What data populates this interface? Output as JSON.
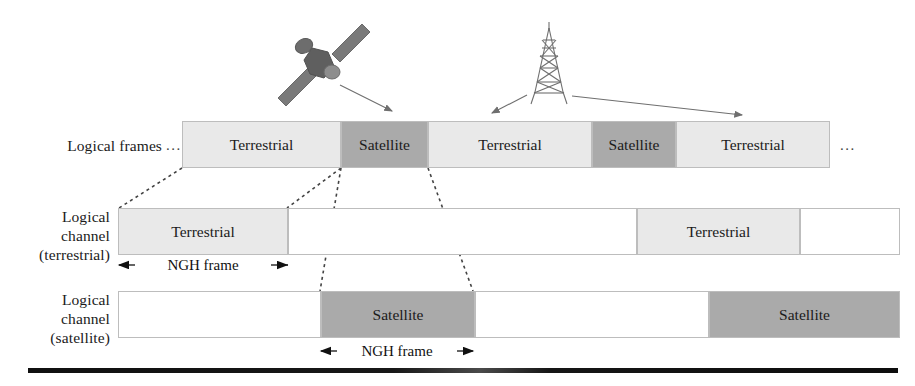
{
  "figure": {
    "colors": {
      "terrestrial_fill": "#e9e9e9",
      "satellite_fill": "#aaaaaa",
      "empty_fill": "#ffffff",
      "outline": "#bdbdbd",
      "text": "#1b1b1b",
      "bottom_bar": "#111111"
    }
  },
  "icons": {
    "satellite": "satellite-icon",
    "tower": "broadcast-tower-icon"
  },
  "rows": {
    "logical_frames": {
      "label": "Logical frames",
      "leading_ellipsis": "...",
      "trailing_ellipsis": "...",
      "cells": [
        {
          "label": "Terrestrial",
          "type": "terrestrial"
        },
        {
          "label": "Satellite",
          "type": "satellite"
        },
        {
          "label": "Terrestrial",
          "type": "terrestrial"
        },
        {
          "label": "Satellite",
          "type": "satellite"
        },
        {
          "label": "Terrestrial",
          "type": "terrestrial"
        }
      ]
    },
    "logical_channel_terrestrial": {
      "label_line1": "Logical",
      "label_line2": "channel",
      "label_line3": "(terrestrial)",
      "measure_label": "NGH frame",
      "cells": [
        {
          "label": "Terrestrial",
          "type": "terrestrial"
        },
        {
          "label": "",
          "type": "empty"
        },
        {
          "label": "Terrestrial",
          "type": "terrestrial"
        },
        {
          "label": "",
          "type": "empty"
        }
      ]
    },
    "logical_channel_satellite": {
      "label_line1": "Logical",
      "label_line2": "channel",
      "label_line3": "(satellite)",
      "measure_label": "NGH frame",
      "cells": [
        {
          "label": "",
          "type": "empty"
        },
        {
          "label": "Satellite",
          "type": "satellite"
        },
        {
          "label": "",
          "type": "empty"
        },
        {
          "label": "Satellite",
          "type": "satellite"
        }
      ]
    }
  }
}
